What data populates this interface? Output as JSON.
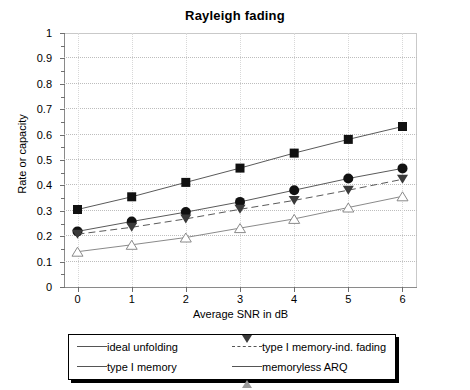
{
  "chart_data": {
    "type": "line",
    "title": "Rayleigh fading",
    "xlabel": "Average SNR in dB",
    "ylabel": "Rate or capacity",
    "x": [
      0,
      1,
      2,
      3,
      4,
      5,
      6
    ],
    "xlim": [
      -0.25,
      6.25
    ],
    "ylim": [
      0,
      1
    ],
    "xticks": [
      "0",
      "1",
      "2",
      "3",
      "4",
      "5",
      "6"
    ],
    "yticks": [
      "0",
      "0.1",
      "0.2",
      "0.3",
      "0.4",
      "0.5",
      "0.6",
      "0.7",
      "0.8",
      "0.9",
      "1"
    ],
    "grid": true,
    "legend_position": "below-plot",
    "series": [
      {
        "name": "ideal unfolding",
        "marker": "filled-square",
        "linestyle": "solid",
        "color": "#111111",
        "values": [
          0.305,
          0.355,
          0.412,
          0.468,
          0.527,
          0.581,
          0.632
        ]
      },
      {
        "name": "type I memory",
        "marker": "filled-circle",
        "linestyle": "solid",
        "color": "#111111",
        "values": [
          0.219,
          0.258,
          0.295,
          0.335,
          0.381,
          0.427,
          0.467
        ]
      },
      {
        "name": "type I memory-ind. fading",
        "marker": "filled-triangle-down",
        "linestyle": "dashed",
        "color": "#3a3a3a",
        "values": [
          0.208,
          0.235,
          0.268,
          0.306,
          0.341,
          0.381,
          0.424
        ]
      },
      {
        "name": "memoryless ARQ",
        "marker": "open-triangle-up",
        "linestyle": "solid",
        "color": "#8f8f8f",
        "values": [
          0.139,
          0.166,
          0.195,
          0.232,
          0.268,
          0.313,
          0.357
        ]
      }
    ]
  },
  "legend": {
    "entries": [
      {
        "label": "ideal unfolding"
      },
      {
        "label": "type I memory"
      },
      {
        "label": "type I memory-ind. fading"
      },
      {
        "label": "memoryless ARQ"
      }
    ]
  }
}
